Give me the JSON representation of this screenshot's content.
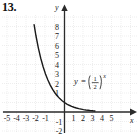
{
  "problem": {
    "number": "13."
  },
  "chart_data": {
    "type": "line",
    "title": "",
    "subtitle": "",
    "xlabel": "x",
    "ylabel": "y",
    "xlim": [
      -5.8,
      5.9
    ],
    "ylim": [
      -2.6,
      9.2
    ],
    "grid": true,
    "grid_spacing": 1,
    "legend_position": "inside-right",
    "annotations": [
      {
        "text": "y = (1/2)^x",
        "parts": {
          "lhs": "y",
          "equals": "=",
          "numerator": "1",
          "denominator": "2",
          "exponent": "x"
        },
        "x": 1.2,
        "y": 3.0
      }
    ],
    "x_ticks": [
      -5,
      -4,
      -3,
      -2,
      -1,
      1,
      2,
      3,
      4,
      5
    ],
    "x_tick_labels": [
      "-5",
      "-4",
      "-3",
      "-2",
      "-1",
      "1",
      "2",
      "3",
      "4",
      "5"
    ],
    "y_ticks": [
      8,
      7,
      6,
      5,
      4,
      3,
      2,
      1,
      -1,
      -2
    ],
    "y_tick_labels": [
      "8",
      "7",
      "6",
      "5",
      "4",
      "3",
      "2",
      "1",
      "-1",
      "-2"
    ],
    "series": [
      {
        "name": "y = (1/2)^x",
        "function": "(1/2)^x",
        "base": 0.5,
        "color": "#1a1a1a",
        "x": [
          -3.2,
          -3.0,
          -2.75,
          -2.5,
          -2.25,
          -2.0,
          -1.75,
          -1.5,
          -1.25,
          -1.0,
          -0.75,
          -0.5,
          -0.25,
          0.0,
          0.25,
          0.5,
          0.75,
          1.0,
          1.25,
          1.5,
          1.75,
          2.0,
          2.25,
          2.5,
          2.75,
          3.0,
          3.2
        ],
        "y": [
          9.19,
          8.0,
          6.73,
          5.66,
          4.76,
          4.0,
          3.36,
          2.83,
          2.38,
          2.0,
          1.68,
          1.41,
          1.19,
          1.0,
          0.84,
          0.71,
          0.59,
          0.5,
          0.42,
          0.35,
          0.3,
          0.25,
          0.21,
          0.18,
          0.15,
          0.125,
          0.11
        ]
      }
    ],
    "colors": {
      "curve": "#1a1a1a",
      "axis": "#333333",
      "grid": "#d9d9d9",
      "text": "#1a1a1a",
      "background": "#ffffff"
    }
  }
}
